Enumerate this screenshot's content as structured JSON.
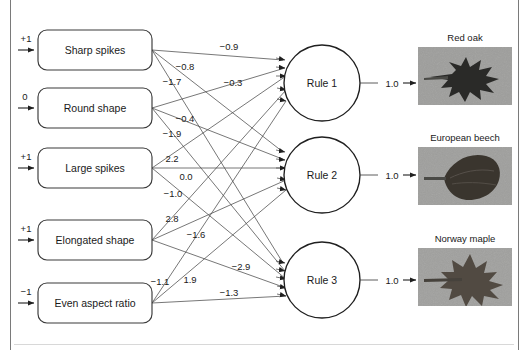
{
  "figure": {
    "frame_color": "#7a7a7a"
  },
  "inputs": [
    {
      "value": "+1",
      "label": "Sharp spikes"
    },
    {
      "value": "0",
      "label": "Round shape"
    },
    {
      "value": "+1",
      "label": "Large spikes"
    },
    {
      "value": "+1",
      "label": "Elongated shape"
    },
    {
      "value": "−1",
      "label": "Even aspect ratio"
    }
  ],
  "rules": [
    {
      "label": "Rule 1",
      "output": "1.0"
    },
    {
      "label": "Rule 2",
      "output": "1.0"
    },
    {
      "label": "Rule 3",
      "output": "1.0"
    }
  ],
  "weights": [
    {
      "text": "−0.9"
    },
    {
      "text": "−0.8"
    },
    {
      "text": "−1.7"
    },
    {
      "text": "−0.3"
    },
    {
      "text": "−0.4"
    },
    {
      "text": "−1.9"
    },
    {
      "text": "2.2"
    },
    {
      "text": "0.0"
    },
    {
      "text": "−1.0"
    },
    {
      "text": "2.8"
    },
    {
      "text": "−1.6"
    },
    {
      "text": "−2.9"
    },
    {
      "text": "1.9"
    },
    {
      "text": "−1.1"
    },
    {
      "text": "−1.3"
    }
  ],
  "species": [
    {
      "caption": "Red oak",
      "leaf_type": "oak"
    },
    {
      "caption": "European beech",
      "leaf_type": "beech"
    },
    {
      "caption": "Norway maple",
      "leaf_type": "maple"
    }
  ]
}
